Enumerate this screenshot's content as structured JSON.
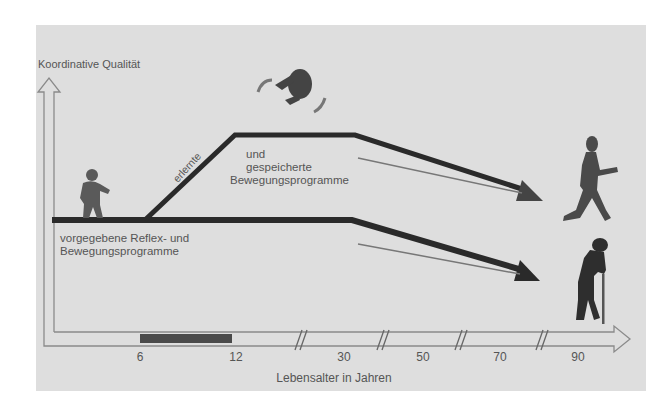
{
  "diagram": {
    "y_axis_label": "Koordinative Qualität",
    "x_axis_label": "Lebensalter in Jahren",
    "x_ticks": [
      "6",
      "12",
      "30",
      "50",
      "70",
      "90"
    ],
    "upper_band": {
      "slope_label": "erlernte",
      "label_line1": "und",
      "label_line2": "gespeicherte",
      "label_line3": "Bewegungsprogramme"
    },
    "lower_band": {
      "label_line1": "vorgegebene Reflex- und",
      "label_line2": "Bewegungsprogramme"
    },
    "highlight_range": [
      "6",
      "12"
    ],
    "figures": [
      {
        "name": "toddler",
        "position": "left, on baseline"
      },
      {
        "name": "tumbling-figure",
        "position": "top center"
      },
      {
        "name": "walking-elderly",
        "position": "right, upper path end"
      },
      {
        "name": "elderly-with-cane",
        "position": "right, lower path end"
      }
    ],
    "colors": {
      "panel_bg": "#dedede",
      "line": "#2a2a2a",
      "text": "#555555",
      "range_bar": "#4a4a4a"
    }
  }
}
